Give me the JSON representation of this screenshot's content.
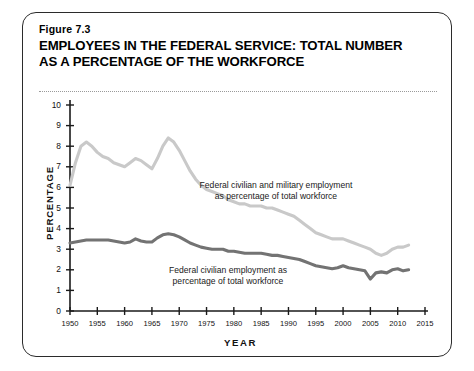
{
  "figure": {
    "number": "Figure 7.3",
    "title_line1": "EMPLOYEES IN THE FEDERAL SERVICE: TOTAL NUMBER",
    "title_line2": "AS A PERCENTAGE OF THE WORKFORCE"
  },
  "colors": {
    "total_series": "#c9c9c9",
    "civilian_series": "#737373",
    "axis": "#1a1a1a",
    "card_border": "#2b2b2b",
    "rule": "#9a9a9a"
  },
  "chart_data": {
    "type": "line",
    "title": "EMPLOYEES IN THE FEDERAL SERVICE: TOTAL NUMBER AS A PERCENTAGE OF THE WORKFORCE",
    "xlabel": "YEAR",
    "ylabel": "PERCENTAGE",
    "xlim": [
      1950,
      2015
    ],
    "ylim": [
      0,
      10
    ],
    "grid": false,
    "legend": "inline-annotations",
    "xticks": [
      1950,
      1955,
      1960,
      1965,
      1970,
      1975,
      1980,
      1985,
      1990,
      1995,
      2000,
      2005,
      2010,
      2015
    ],
    "xtick_labels": [
      "1950",
      "1955",
      "1960",
      "1965",
      "1970",
      "1975",
      "1980",
      "1985",
      "1990",
      "1995",
      "2000",
      "2005",
      "2010",
      "2015"
    ],
    "yticks": [
      0,
      1,
      2,
      3,
      4,
      5,
      6,
      7,
      8,
      9,
      10
    ],
    "ytick_labels": [
      "0",
      "1",
      "2",
      "3",
      "4",
      "5",
      "6",
      "7",
      "8",
      "9",
      "10"
    ],
    "series": [
      {
        "name": "Federal civilian and military employment as percentage of total workforce",
        "color": "#c9c9c9",
        "annotation": {
          "line1": "Federal civilian and military employment",
          "line2": "as percentage of total workforce"
        },
        "x": [
          1950,
          1951,
          1952,
          1953,
          1954,
          1955,
          1956,
          1957,
          1958,
          1959,
          1960,
          1961,
          1962,
          1963,
          1964,
          1965,
          1966,
          1967,
          1968,
          1969,
          1970,
          1971,
          1972,
          1973,
          1974,
          1975,
          1976,
          1977,
          1978,
          1979,
          1980,
          1981,
          1982,
          1983,
          1984,
          1985,
          1986,
          1987,
          1988,
          1989,
          1990,
          1991,
          1992,
          1993,
          1994,
          1995,
          1996,
          1997,
          1998,
          1999,
          2000,
          2001,
          2002,
          2003,
          2004,
          2005,
          2006,
          2007,
          2008,
          2009,
          2010,
          2011,
          2012
        ],
        "y": [
          6.1,
          7.2,
          8.0,
          8.2,
          8.0,
          7.7,
          7.5,
          7.4,
          7.2,
          7.1,
          7.0,
          7.2,
          7.4,
          7.3,
          7.1,
          6.9,
          7.4,
          8.0,
          8.4,
          8.2,
          7.8,
          7.3,
          6.8,
          6.4,
          6.1,
          5.9,
          5.8,
          5.7,
          5.6,
          5.4,
          5.3,
          5.2,
          5.2,
          5.1,
          5.1,
          5.1,
          5.0,
          5.0,
          4.9,
          4.8,
          4.7,
          4.6,
          4.4,
          4.2,
          4.0,
          3.8,
          3.7,
          3.6,
          3.5,
          3.5,
          3.5,
          3.4,
          3.3,
          3.2,
          3.1,
          3.0,
          2.8,
          2.7,
          2.8,
          3.0,
          3.1,
          3.1,
          3.2
        ]
      },
      {
        "name": "Federal civilian employment as percentage of total workforce",
        "color": "#737373",
        "annotation": {
          "line1": "Federal civilian employment as",
          "line2": "percentage of total workforce"
        },
        "x": [
          1950,
          1951,
          1952,
          1953,
          1954,
          1955,
          1956,
          1957,
          1958,
          1959,
          1960,
          1961,
          1962,
          1963,
          1964,
          1965,
          1966,
          1967,
          1968,
          1969,
          1970,
          1971,
          1972,
          1973,
          1974,
          1975,
          1976,
          1977,
          1978,
          1979,
          1980,
          1981,
          1982,
          1983,
          1984,
          1985,
          1986,
          1987,
          1988,
          1989,
          1990,
          1991,
          1992,
          1993,
          1994,
          1995,
          1996,
          1997,
          1998,
          1999,
          2000,
          2001,
          2002,
          2003,
          2004,
          2005,
          2006,
          2007,
          2008,
          2009,
          2010,
          2011,
          2012
        ],
        "y": [
          3.3,
          3.35,
          3.4,
          3.45,
          3.45,
          3.45,
          3.45,
          3.45,
          3.4,
          3.35,
          3.3,
          3.35,
          3.5,
          3.4,
          3.35,
          3.35,
          3.55,
          3.7,
          3.75,
          3.7,
          3.6,
          3.45,
          3.3,
          3.2,
          3.1,
          3.05,
          3.0,
          3.0,
          3.0,
          2.9,
          2.9,
          2.85,
          2.8,
          2.8,
          2.8,
          2.8,
          2.75,
          2.7,
          2.7,
          2.65,
          2.6,
          2.55,
          2.5,
          2.4,
          2.3,
          2.2,
          2.15,
          2.1,
          2.05,
          2.1,
          2.2,
          2.1,
          2.05,
          2.0,
          1.95,
          1.55,
          1.85,
          1.9,
          1.85,
          2.0,
          2.05,
          1.95,
          2.0
        ]
      }
    ]
  }
}
